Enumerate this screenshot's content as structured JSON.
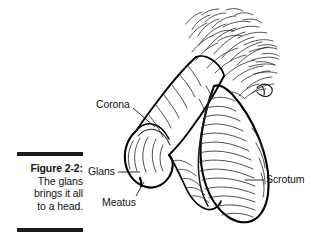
{
  "figure": {
    "caption": {
      "figure_number": "Figure 2-2:",
      "lines": [
        "The glans",
        "brings it all",
        "to a head."
      ]
    },
    "labels": [
      {
        "id": "corona",
        "text": "Corona"
      },
      {
        "id": "glans",
        "text": "Glans"
      },
      {
        "id": "meatus",
        "text": "Meatus"
      },
      {
        "id": "scrotum",
        "text": "Scrotum"
      }
    ],
    "colors": {
      "ink": "#000000",
      "rule": "#1a1a1a",
      "paper": "#ffffff",
      "hatch": "#3a3a3a"
    },
    "illustration": {
      "subject": "anatomical line drawing of penis and scrotum",
      "elements": [
        "pubic-hair-strokes",
        "shaft",
        "corona-ridge",
        "glans",
        "meatus",
        "scrotum-with-rugae"
      ]
    }
  }
}
